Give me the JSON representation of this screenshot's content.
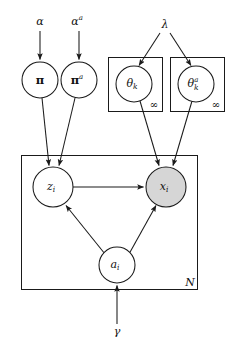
{
  "figure": {
    "type": "plate-notation-graphical-model",
    "title": "",
    "background_color": "#ffffff",
    "stroke_color": "#1a1a1a",
    "observed_node_fill": "#d6d6d6",
    "latent_node_fill": "#ffffff"
  },
  "hyperparameters": [
    {
      "id": "alpha",
      "label": "α",
      "superscript": "",
      "x": 40,
      "y": 22
    },
    {
      "id": "alpha_a",
      "label": "α",
      "superscript": "a",
      "x": 79,
      "y": 22
    },
    {
      "id": "lambda",
      "label": "λ",
      "superscript": "",
      "x": 165,
      "y": 25
    },
    {
      "id": "gamma",
      "label": "γ",
      "superscript": "",
      "x": 117,
      "y": 332
    }
  ],
  "nodes": [
    {
      "id": "pi",
      "label": "π",
      "subscript": "",
      "superscript": "",
      "bold": true,
      "observed": false,
      "cx": 40,
      "cy": 80,
      "r": 18
    },
    {
      "id": "pi_a",
      "label": "π",
      "subscript": "",
      "superscript": "a",
      "bold": true,
      "observed": false,
      "cx": 79,
      "cy": 80,
      "r": 18
    },
    {
      "id": "theta_k",
      "label": "θ",
      "subscript": "k",
      "superscript": "",
      "bold": false,
      "observed": false,
      "cx": 134,
      "cy": 84,
      "r": 18
    },
    {
      "id": "theta_k_a",
      "label": "θ",
      "subscript": "k",
      "superscript": "a",
      "bold": false,
      "observed": false,
      "cx": 196,
      "cy": 84,
      "r": 18
    },
    {
      "id": "z_i",
      "label": "z",
      "subscript": "i",
      "superscript": "",
      "bold": false,
      "observed": false,
      "cx": 53,
      "cy": 187,
      "r": 20
    },
    {
      "id": "x_i",
      "label": "x",
      "subscript": "i",
      "superscript": "",
      "bold": false,
      "observed": true,
      "cx": 166,
      "cy": 187,
      "r": 20
    },
    {
      "id": "a_i",
      "label": "a",
      "subscript": "i",
      "superscript": "",
      "bold": false,
      "observed": false,
      "cx": 117,
      "cy": 265,
      "r": 18
    }
  ],
  "plates": [
    {
      "id": "plate-theta-k",
      "label": "∞",
      "label_kind": "infinity",
      "x": 108,
      "y": 57,
      "w": 55,
      "h": 55,
      "label_x": 154,
      "label_y": 104
    },
    {
      "id": "plate-theta-k-a",
      "label": "∞",
      "label_kind": "infinity",
      "x": 170,
      "y": 57,
      "w": 55,
      "h": 55,
      "label_x": 216,
      "label_y": 104
    },
    {
      "id": "plate-N",
      "label": "N",
      "label_kind": "count",
      "x": 21,
      "y": 155,
      "w": 177,
      "h": 135,
      "label_x": 190,
      "label_y": 283
    }
  ],
  "edges": [
    {
      "id": "alpha-to-pi",
      "from": "alpha",
      "to": "pi",
      "kind": "arrow"
    },
    {
      "id": "alpha_a-to-pi_a",
      "from": "alpha_a",
      "to": "pi_a",
      "kind": "arrow"
    },
    {
      "id": "lambda-to-theta_k",
      "from": "lambda",
      "to": "theta_k",
      "kind": "arrow"
    },
    {
      "id": "lambda-to-theta_k_a",
      "from": "lambda",
      "to": "theta_k_a",
      "kind": "arrow"
    },
    {
      "id": "pi-to-z_i",
      "from": "pi",
      "to": "z_i",
      "kind": "arrow"
    },
    {
      "id": "pi_a-to-z_i",
      "from": "pi_a",
      "to": "z_i",
      "kind": "arrow"
    },
    {
      "id": "theta_k-to-x_i",
      "from": "theta_k",
      "to": "x_i",
      "kind": "arrow"
    },
    {
      "id": "theta_k_a-to-x_i",
      "from": "theta_k_a",
      "to": "x_i",
      "kind": "arrow"
    },
    {
      "id": "z_i-to-x_i",
      "from": "z_i",
      "to": "x_i",
      "kind": "arrow"
    },
    {
      "id": "a_i-to-z_i",
      "from": "a_i",
      "to": "z_i",
      "kind": "arrow"
    },
    {
      "id": "a_i-to-x_i",
      "from": "a_i",
      "to": "x_i",
      "kind": "arrow"
    },
    {
      "id": "gamma-to-a_i",
      "from": "gamma",
      "to": "a_i",
      "kind": "arrow"
    }
  ]
}
